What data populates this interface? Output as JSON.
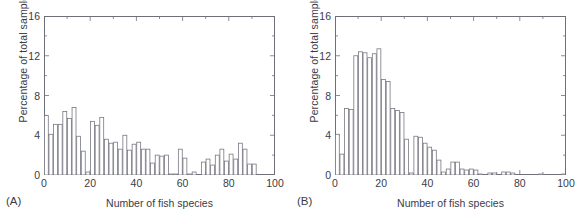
{
  "figure": {
    "panels": [
      {
        "tag": "(A)",
        "xlabel": "Number of fish species",
        "ylabel": "Percentage of total samples"
      },
      {
        "tag": "(B)",
        "xlabel": "Number of fish species",
        "ylabel": "Percentage of total samples"
      }
    ]
  },
  "chart_data": [
    {
      "type": "bar",
      "title": "",
      "panel": "(A)",
      "xlabel": "Number of fish species",
      "ylabel": "Percentage of total samples",
      "xlim": [
        0,
        100
      ],
      "ylim": [
        0,
        16
      ],
      "xticks": [
        0,
        20,
        40,
        60,
        80,
        100
      ],
      "yticks": [
        0,
        4,
        8,
        12,
        16
      ],
      "grid": false,
      "legend": null,
      "bin_width": 2,
      "bar_color": "#ffffff",
      "bar_edge_color": "#6f6f7a",
      "categories": [
        1,
        3,
        5,
        7,
        9,
        11,
        13,
        15,
        17,
        19,
        21,
        23,
        25,
        27,
        29,
        31,
        33,
        35,
        37,
        39,
        41,
        43,
        45,
        47,
        49,
        51,
        53,
        55,
        57,
        59,
        61,
        63,
        65,
        67,
        69,
        71,
        73,
        75,
        77,
        79,
        81,
        83,
        85,
        87,
        89,
        91,
        93,
        95,
        97,
        99
      ],
      "values": [
        6.0,
        4.1,
        5.1,
        5.1,
        6.4,
        5.7,
        6.8,
        3.9,
        2.4,
        0.3,
        5.4,
        5.0,
        5.8,
        3.6,
        3.2,
        3.3,
        2.6,
        4.0,
        2.5,
        3.1,
        3.3,
        2.6,
        2.6,
        1.2,
        2.0,
        1.9,
        2.0,
        0.1,
        0.1,
        2.6,
        1.7,
        0.1,
        0.3,
        0.0,
        1.3,
        1.6,
        1.0,
        2.0,
        2.6,
        1.4,
        2.1,
        1.6,
        3.2,
        2.6,
        1.1,
        1.1,
        0.0,
        0.0,
        0.0,
        0.0
      ]
    },
    {
      "type": "bar",
      "title": "",
      "panel": "(B)",
      "xlabel": "Number of fish species",
      "ylabel": "Percentage of total samples",
      "xlim": [
        0,
        100
      ],
      "ylim": [
        0,
        16
      ],
      "xticks": [
        0,
        20,
        40,
        60,
        80,
        100
      ],
      "yticks": [
        0,
        4,
        8,
        12,
        16
      ],
      "grid": false,
      "legend": null,
      "bin_width": 2,
      "bar_color": "#ffffff",
      "bar_edge_color": "#6f6f7a",
      "categories": [
        1,
        3,
        5,
        7,
        9,
        11,
        13,
        15,
        17,
        19,
        21,
        23,
        25,
        27,
        29,
        31,
        33,
        35,
        37,
        39,
        41,
        43,
        45,
        47,
        49,
        51,
        53,
        55,
        57,
        59,
        61,
        63,
        65,
        67,
        69,
        71,
        73,
        75,
        77,
        79,
        81,
        83,
        85,
        87,
        89,
        91,
        93,
        95,
        97,
        99
      ],
      "values": [
        4.1,
        2.1,
        6.7,
        6.6,
        12.0,
        12.4,
        12.3,
        11.8,
        12.2,
        12.7,
        9.6,
        9.4,
        6.7,
        6.5,
        6.3,
        3.6,
        0.2,
        3.9,
        3.8,
        3.2,
        2.8,
        2.5,
        1.5,
        0.3,
        0.6,
        1.3,
        1.3,
        0.6,
        0.5,
        0.6,
        0.5,
        0.1,
        0.0,
        0.2,
        0.2,
        0.0,
        0.3,
        0.3,
        0.2,
        0.0,
        0.0,
        0.0,
        0.0,
        0.0,
        0.1,
        0.0,
        0.0,
        0.0,
        0.0,
        0.1
      ]
    }
  ]
}
